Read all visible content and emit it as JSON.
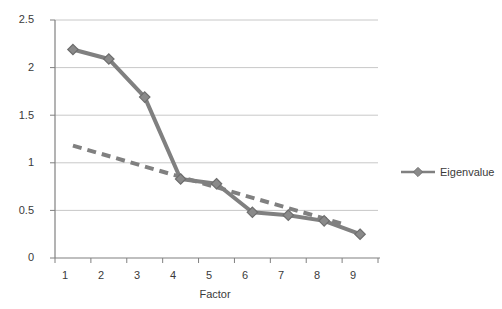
{
  "chart_data": {
    "type": "line",
    "title": "",
    "xlabel": "Factor",
    "ylabel": "",
    "xlim": [
      0.5,
      9.5
    ],
    "ylim": [
      0,
      2.5
    ],
    "grid": true,
    "legend_position": "right",
    "x": [
      1,
      2,
      3,
      4,
      5,
      6,
      7,
      8,
      9
    ],
    "xtick_labels": [
      "1",
      "2",
      "3",
      "4",
      "5",
      "6",
      "7",
      "8",
      "9"
    ],
    "ytick_labels": [
      "0",
      "0.5",
      "1",
      "1.5",
      "2",
      "2.5"
    ],
    "ytick_values": [
      0,
      0.5,
      1,
      1.5,
      2,
      2.5
    ],
    "series": [
      {
        "name": "Eigenvalue",
        "style": "solid-diamond-marker",
        "color": "#808080",
        "values": [
          2.19,
          2.09,
          1.69,
          0.83,
          0.78,
          0.48,
          0.45,
          0.39,
          0.25
        ]
      },
      {
        "name": "Trend",
        "style": "dashed",
        "color": "#808080",
        "x_endpoints": [
          1,
          8.5
        ],
        "y_endpoints": [
          1.18,
          0.36
        ]
      }
    ],
    "legend": [
      "Eigenvalue"
    ],
    "axis_color": "#808080",
    "grid_color": "#c8c8c8",
    "text_color": "#3a3a3a"
  },
  "legend": {
    "entries": [
      {
        "label": "Eigenvalue",
        "marker": "diamond-marker",
        "color": "#808080"
      }
    ]
  },
  "axes": {
    "x_title": "Factor"
  }
}
